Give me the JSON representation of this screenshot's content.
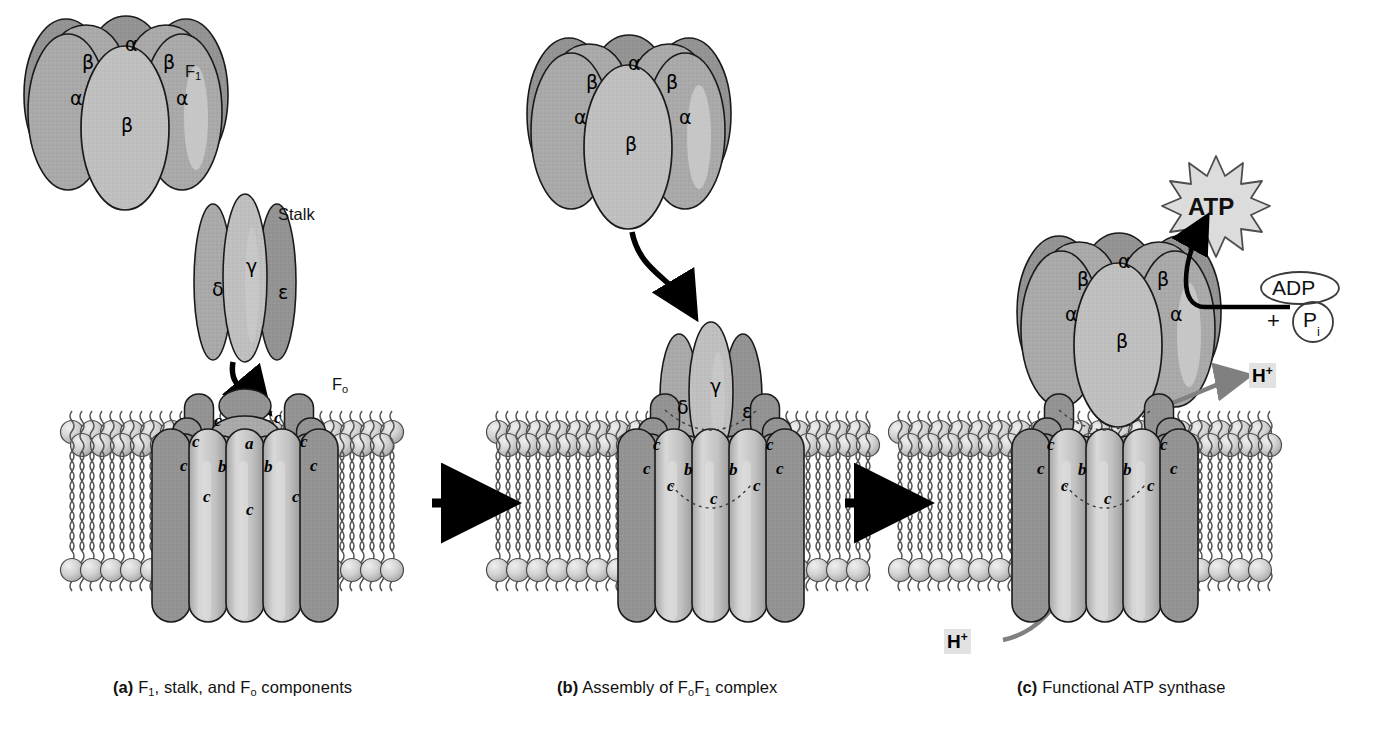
{
  "figure": {
    "background": "#ffffff"
  },
  "colors": {
    "subunit_fill": "#a9a9a9",
    "subunit_fill_light": "#bdbdbd",
    "subunit_shadow": "#8e8e8e",
    "subunit_highlight": "#c9c9c9",
    "c_subunit_fill": "#bcbcbc",
    "c_subunit_light": "#d2d2d2",
    "lipid_head_fill": "#cfcfcf",
    "lipid_head_stroke": "#4a4a4a",
    "outline": "#1a1a1a",
    "arrow_black": "#000000",
    "arrow_gray": "#808080",
    "atp_star_fill": "#dcdcdc",
    "highlight_bg": "#e2e2e2"
  },
  "panels": [
    {
      "id": "a",
      "caption_marker": "(a)",
      "caption_text_parts": [
        "F",
        "1",
        ", stalk, and F",
        "o",
        " components"
      ],
      "caption_plain": "(a) F1, stalk, and Fo components",
      "labels": [
        {
          "name": "f1-label",
          "text": "F",
          "sub": "1",
          "x": 185,
          "y": 72
        },
        {
          "name": "stalk-label",
          "text": "Stalk",
          "sub": "",
          "x": 288,
          "y": 215
        },
        {
          "name": "fo-label",
          "text": "F",
          "sub": "o",
          "x": 332,
          "y": 385
        }
      ],
      "f1_subunits": [
        {
          "label": "α",
          "x": 125,
          "y": 33
        },
        {
          "label": "β",
          "x": 82,
          "y": 51
        },
        {
          "label": "β",
          "x": 163,
          "y": 51
        },
        {
          "label": "α",
          "x": 70,
          "y": 87
        },
        {
          "label": "α",
          "x": 176,
          "y": 87
        },
        {
          "label": "β",
          "x": 121,
          "y": 114
        }
      ],
      "stalk_subunits": [
        {
          "label": "δ",
          "x": 212,
          "y": 278
        },
        {
          "label": "γ",
          "x": 246,
          "y": 255
        },
        {
          "label": "ε",
          "x": 278,
          "y": 281
        }
      ],
      "fo_subunits": [
        {
          "label": "c",
          "x": 214,
          "y": 411
        },
        {
          "label": "c",
          "x": 274,
          "y": 408
        },
        {
          "label": "c",
          "x": 192,
          "y": 432
        },
        {
          "label": "c",
          "x": 300,
          "y": 432
        },
        {
          "label": "a",
          "x": 245,
          "y": 434
        },
        {
          "label": "c",
          "x": 180,
          "y": 456
        },
        {
          "label": "b",
          "x": 218,
          "y": 457
        },
        {
          "label": "b",
          "x": 264,
          "y": 457
        },
        {
          "label": "c",
          "x": 310,
          "y": 456
        },
        {
          "label": "c",
          "x": 203,
          "y": 487
        },
        {
          "label": "c",
          "x": 246,
          "y": 500
        },
        {
          "label": "c",
          "x": 292,
          "y": 487
        }
      ],
      "arrows": [
        {
          "name": "stalk-to-fo-arrow",
          "style": "curved-black"
        }
      ]
    },
    {
      "id": "b",
      "caption_marker": "(b)",
      "caption_text_parts": [
        "Assembly of F",
        "o",
        "F",
        "1",
        " complex"
      ],
      "caption_plain": "(b) Assembly of FoF1 complex",
      "labels": [],
      "f1_subunits": [
        {
          "label": "α",
          "x": 628,
          "y": 52
        },
        {
          "label": "β",
          "x": 586,
          "y": 71
        },
        {
          "label": "β",
          "x": 666,
          "y": 71
        },
        {
          "label": "α",
          "x": 574,
          "y": 106
        },
        {
          "label": "α",
          "x": 679,
          "y": 106
        },
        {
          "label": "β",
          "x": 625,
          "y": 133
        }
      ],
      "stalk_subunits": [
        {
          "label": "δ",
          "x": 677,
          "y": 396
        },
        {
          "label": "γ",
          "x": 710,
          "y": 375
        },
        {
          "label": "ε",
          "x": 742,
          "y": 400
        }
      ],
      "fo_subunits": [
        {
          "label": "c",
          "x": 653,
          "y": 435
        },
        {
          "label": "c",
          "x": 766,
          "y": 435
        },
        {
          "label": "c",
          "x": 643,
          "y": 459
        },
        {
          "label": "c",
          "x": 776,
          "y": 459
        },
        {
          "label": "b",
          "x": 684,
          "y": 460
        },
        {
          "label": "b",
          "x": 729,
          "y": 460
        },
        {
          "label": "c",
          "x": 667,
          "y": 476
        },
        {
          "label": "c",
          "x": 710,
          "y": 489
        },
        {
          "label": "c",
          "x": 753,
          "y": 476
        }
      ],
      "arrows": [
        {
          "name": "f1-descent-arrow",
          "style": "curved-black"
        },
        {
          "name": "panel-a-to-b-arrow",
          "style": "straight-black"
        }
      ]
    },
    {
      "id": "c",
      "caption_marker": "(c)",
      "caption_text_parts": [
        "Functional ATP synthase"
      ],
      "caption_plain": "(c) Functional ATP synthase",
      "labels": [],
      "f1_subunits": [
        {
          "label": "α",
          "x": 1118,
          "y": 250
        },
        {
          "label": "β",
          "x": 1077,
          "y": 268
        },
        {
          "label": "β",
          "x": 1157,
          "y": 268
        },
        {
          "label": "α",
          "x": 1065,
          "y": 303
        },
        {
          "label": "α",
          "x": 1170,
          "y": 303
        },
        {
          "label": "β",
          "x": 1116,
          "y": 330
        }
      ],
      "stalk_subunits": [],
      "fo_subunits": [
        {
          "label": "c",
          "x": 1047,
          "y": 435
        },
        {
          "label": "c",
          "x": 1160,
          "y": 435
        },
        {
          "label": "c",
          "x": 1037,
          "y": 459
        },
        {
          "label": "c",
          "x": 1170,
          "y": 459
        },
        {
          "label": "b",
          "x": 1078,
          "y": 460
        },
        {
          "label": "b",
          "x": 1123,
          "y": 460
        },
        {
          "label": "c",
          "x": 1061,
          "y": 476
        },
        {
          "label": "c",
          "x": 1104,
          "y": 489
        },
        {
          "label": "c",
          "x": 1147,
          "y": 476
        }
      ],
      "products": {
        "atp": {
          "name": "atp-burst",
          "text": "ATP",
          "x": 1216,
          "y": 182
        },
        "adp": {
          "name": "adp-ellipse",
          "text": "ADP",
          "x": 1300,
          "y": 288
        },
        "plus": {
          "name": "plus-sign",
          "text": "+",
          "x": 1276,
          "y": 322
        },
        "pi": {
          "name": "pi-circle",
          "text": "P",
          "sub": "i",
          "x": 1313,
          "y": 322
        }
      },
      "protons": [
        {
          "name": "proton-out-label",
          "text": "H",
          "sup": "+",
          "x": 1262,
          "y": 376,
          "arrow": "gray-right"
        },
        {
          "name": "proton-in-label",
          "text": "H",
          "sup": "+",
          "x": 958,
          "y": 642,
          "arrow": "gray-up"
        }
      ],
      "arrows": [
        {
          "name": "atp-production-arrow",
          "style": "curved-black"
        },
        {
          "name": "panel-b-to-c-arrow",
          "style": "straight-black"
        }
      ]
    }
  ],
  "membrane": {
    "name": "lipid-bilayer",
    "description": "phospholipid bilayer with spherical head groups and wavy acyl tails",
    "segments": [
      {
        "panel": "a",
        "x_start": 60,
        "x_end": 400
      },
      {
        "panel": "b",
        "x_start": 490,
        "x_end": 880
      },
      {
        "panel": "c",
        "x_start": 880,
        "x_end": 1280
      }
    ]
  }
}
